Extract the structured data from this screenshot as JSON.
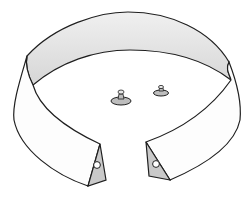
{
  "illustration": {
    "subject": "detachable shirt collar with two collar studs",
    "parts": [
      "collar-band",
      "collar-inner-band",
      "left-collar-tip",
      "right-collar-tip",
      "collar-stud-left",
      "collar-stud-right"
    ],
    "colors": {
      "background": "#ffffff",
      "outline": "#1f1f1f",
      "inner_band": "#e4e4e4",
      "collar_face": "#fdfdfd",
      "tab_shade": "#c9c9c9",
      "stud": "#bdbdbd"
    }
  }
}
